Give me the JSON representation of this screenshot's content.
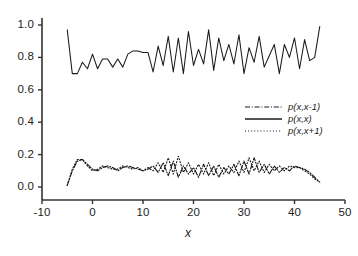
{
  "chart_data": {
    "type": "line",
    "title": "",
    "xlabel": "x",
    "ylabel": "",
    "xlim": [
      -10,
      50
    ],
    "ylim": [
      0.0,
      1.05
    ],
    "grid": false,
    "legend_position": "center-right",
    "xticks": [
      "-10",
      "0",
      "10",
      "20",
      "30",
      "40",
      "50"
    ],
    "xtick_values": [
      -10,
      0,
      10,
      20,
      30,
      40,
      50
    ],
    "yticks": [
      "0.0",
      "0.2",
      "0.4",
      "0.6",
      "0.8",
      "1.0"
    ],
    "ytick_values": [
      0.0,
      0.2,
      0.4,
      0.6,
      0.8,
      1.0
    ],
    "x": [
      -5,
      -4,
      -3,
      -2,
      -1,
      0,
      1,
      2,
      3,
      4,
      5,
      6,
      7,
      8,
      9,
      10,
      11,
      12,
      13,
      14,
      15,
      16,
      17,
      18,
      19,
      20,
      21,
      22,
      23,
      24,
      25,
      26,
      27,
      28,
      29,
      30,
      31,
      32,
      33,
      34,
      35,
      36,
      37,
      38,
      39,
      40,
      41,
      42,
      43,
      44,
      45
    ],
    "series": [
      {
        "name": "p(x,x-1)",
        "style": "dashdot",
        "color": "#1a1a1a",
        "values": [
          0.01,
          0.1,
          0.16,
          0.17,
          0.14,
          0.11,
          0.1,
          0.12,
          0.13,
          0.12,
          0.1,
          0.12,
          0.13,
          0.12,
          0.11,
          0.1,
          0.11,
          0.13,
          0.09,
          0.15,
          0.07,
          0.16,
          0.06,
          0.13,
          0.08,
          0.12,
          0.06,
          0.14,
          0.07,
          0.13,
          0.06,
          0.12,
          0.08,
          0.14,
          0.07,
          0.16,
          0.08,
          0.18,
          0.09,
          0.14,
          0.08,
          0.13,
          0.09,
          0.12,
          0.1,
          0.13,
          0.12,
          0.11,
          0.09,
          0.06,
          0.03
        ]
      },
      {
        "name": "p(x,x)",
        "style": "solid",
        "color": "#1a1a1a",
        "values": [
          0.97,
          0.7,
          0.7,
          0.77,
          0.73,
          0.82,
          0.73,
          0.79,
          0.79,
          0.74,
          0.79,
          0.74,
          0.82,
          0.84,
          0.84,
          0.83,
          0.83,
          0.71,
          0.87,
          0.75,
          0.93,
          0.71,
          0.92,
          0.7,
          0.96,
          0.75,
          0.85,
          0.76,
          0.97,
          0.72,
          0.92,
          0.78,
          0.88,
          0.76,
          0.94,
          0.7,
          0.86,
          0.77,
          0.93,
          0.74,
          0.81,
          0.88,
          0.7,
          0.88,
          0.8,
          0.92,
          0.73,
          0.91,
          0.78,
          0.8,
          0.99
        ]
      },
      {
        "name": "p(x,x+1)",
        "style": "dotted",
        "color": "#1a1a1a",
        "values": [
          0.01,
          0.11,
          0.17,
          0.17,
          0.13,
          0.1,
          0.11,
          0.13,
          0.12,
          0.11,
          0.11,
          0.13,
          0.12,
          0.11,
          0.12,
          0.1,
          0.12,
          0.1,
          0.15,
          0.09,
          0.18,
          0.08,
          0.19,
          0.09,
          0.15,
          0.08,
          0.14,
          0.08,
          0.15,
          0.07,
          0.14,
          0.08,
          0.13,
          0.09,
          0.16,
          0.09,
          0.18,
          0.1,
          0.16,
          0.09,
          0.14,
          0.1,
          0.13,
          0.1,
          0.13,
          0.12,
          0.12,
          0.1,
          0.08,
          0.05,
          0.03
        ]
      }
    ]
  },
  "axes": {
    "x_axis_title": "x"
  }
}
